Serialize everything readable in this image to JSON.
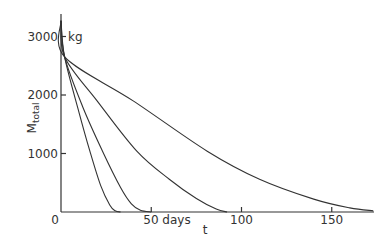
{
  "chart_data": {
    "type": "line",
    "title": "",
    "xlabel": "t",
    "ylabel": "M_total",
    "y_unit": "kg",
    "x_unit": "days",
    "xlim": [
      0,
      175
    ],
    "ylim": [
      0,
      3400
    ],
    "x_ticks": [
      0,
      50,
      100,
      150
    ],
    "x_tick_labels": [
      "0",
      "50 days",
      "100",
      "150"
    ],
    "y_ticks": [
      1000,
      2000,
      3000
    ],
    "y_tick_labels": [
      "1000",
      "2000",
      "3000"
    ],
    "grid": false,
    "legend": null,
    "series": [
      {
        "name": "curve-1",
        "x": [
          0,
          2,
          10,
          16,
          22,
          27,
          30,
          33
        ],
        "y": [
          3270,
          2650,
          1700,
          1040,
          450,
          120,
          20,
          0
        ]
      },
      {
        "name": "curve-2",
        "x": [
          0,
          2,
          12,
          23,
          33,
          39,
          44,
          50
        ],
        "y": [
          3270,
          2650,
          1800,
          1040,
          420,
          140,
          30,
          0
        ]
      },
      {
        "name": "curve-3",
        "x": [
          0,
          2,
          20,
          42,
          60,
          75,
          86,
          92
        ],
        "y": [
          3270,
          2650,
          1900,
          1040,
          560,
          230,
          50,
          0
        ]
      },
      {
        "name": "curve-4",
        "x": [
          0,
          2,
          40,
          81,
          110,
          140,
          160,
          173
        ],
        "y": [
          3270,
          2650,
          1900,
          1040,
          560,
          220,
          70,
          20
        ]
      }
    ]
  }
}
